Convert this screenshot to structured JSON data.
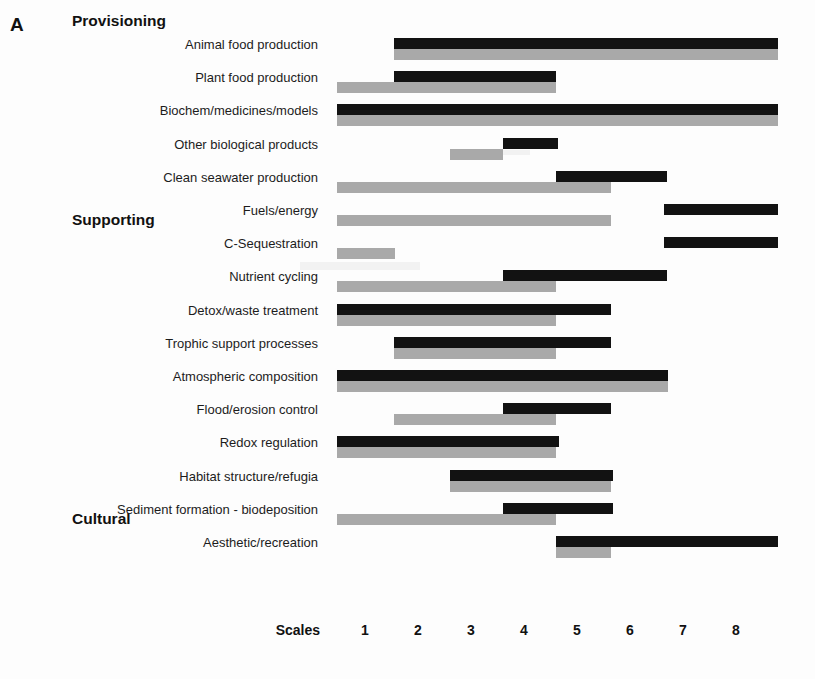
{
  "figure": {
    "panel_letter": "A",
    "axis_title": "Scales",
    "tick_labels": [
      "1",
      "2",
      "3",
      "4",
      "5",
      "6",
      "7",
      "8"
    ],
    "colors": {
      "black_series": "#121212",
      "gray_series": "#a9a9a9",
      "background": "#ffffff",
      "text": "#111111"
    }
  },
  "groups": [
    {
      "name": "Provisioning",
      "row": 0
    },
    {
      "name": "Supporting",
      "row": 7
    },
    {
      "name": "Cultural",
      "row": 16
    }
  ],
  "chart_data": {
    "type": "bar",
    "orientation": "horizontal",
    "title": "",
    "subtitle": "",
    "xlabel": "Scales",
    "ylabel": "",
    "xlim": [
      0.4,
      9.0
    ],
    "xticks": [
      1,
      2,
      3,
      4,
      5,
      6,
      7,
      8
    ],
    "grid": false,
    "legend": "none",
    "note": "Each ecosystem service has two stacked range bars (black = upper series, grey = lower series) spanning a start and end value on the 1-8 Scales axis.",
    "series": [
      {
        "name": "black",
        "color": "#121212"
      },
      {
        "name": "grey",
        "color": "#a9a9a9"
      }
    ],
    "categories": [
      "Animal food production",
      "Plant food production",
      "Biochem/medicines/models",
      "Other biological products",
      "Clean seawater production",
      "Fuels/energy",
      "C-Sequestration",
      "Nutrient cycling",
      "Detox/waste treatment",
      "Trophic support processes",
      "Atmospheric composition",
      "Flood/erosion control",
      "Redox regulation",
      "Habitat structure/refugia",
      "Sediment formation - biodeposition",
      "Aesthetic/recreation"
    ],
    "group_of_category": [
      "Provisioning",
      "Provisioning",
      "Provisioning",
      "Provisioning",
      "Provisioning",
      "Provisioning",
      "Supporting",
      "Supporting",
      "Supporting",
      "Supporting",
      "Supporting",
      "Supporting",
      "Supporting",
      "Supporting",
      "Supporting",
      "Cultural"
    ],
    "ranges": [
      {
        "category": "Animal food production",
        "black": [
          1.55,
          8.8
        ],
        "grey": [
          1.55,
          8.8
        ]
      },
      {
        "category": "Plant food production",
        "black": [
          1.55,
          4.6
        ],
        "grey": [
          0.47,
          4.6
        ]
      },
      {
        "category": "Biochem/medicines/models",
        "black": [
          0.47,
          8.8
        ],
        "grey": [
          0.47,
          8.8
        ]
      },
      {
        "category": "Other biological products",
        "black": [
          3.6,
          4.65
        ],
        "grey": [
          2.6,
          3.6
        ]
      },
      {
        "category": "Clean seawater production",
        "black": [
          4.6,
          6.7
        ],
        "grey": [
          0.47,
          5.65
        ]
      },
      {
        "category": "Fuels/energy",
        "black": [
          6.65,
          8.8
        ],
        "grey": [
          0.47,
          5.65
        ]
      },
      {
        "category": "C-Sequestration",
        "black": [
          6.65,
          8.8
        ],
        "grey": [
          0.47,
          1.57
        ]
      },
      {
        "category": "Nutrient cycling",
        "black": [
          3.6,
          6.7
        ],
        "grey": [
          0.47,
          4.6
        ]
      },
      {
        "category": "Detox/waste treatment",
        "black": [
          0.47,
          5.65
        ],
        "grey": [
          0.47,
          4.6
        ]
      },
      {
        "category": "Trophic support processes",
        "black": [
          1.55,
          5.65
        ],
        "grey": [
          1.55,
          4.6
        ]
      },
      {
        "category": "Atmospheric composition",
        "black": [
          0.47,
          6.72
        ],
        "grey": [
          0.47,
          6.72
        ]
      },
      {
        "category": "Flood/erosion control",
        "black": [
          3.6,
          5.65
        ],
        "grey": [
          1.55,
          4.6
        ]
      },
      {
        "category": "Redox regulation",
        "black": [
          0.47,
          4.66
        ],
        "grey": [
          0.47,
          4.6
        ]
      },
      {
        "category": "Habitat structure/refugia",
        "black": [
          2.6,
          5.68
        ],
        "grey": [
          2.6,
          5.65
        ]
      },
      {
        "category": "Sediment formation - biodeposition",
        "black": [
          3.6,
          5.68
        ],
        "grey": [
          0.47,
          4.6
        ]
      },
      {
        "category": "Aesthetic/recreation",
        "black": [
          4.6,
          8.8
        ],
        "grey": [
          4.6,
          5.65
        ]
      }
    ]
  }
}
